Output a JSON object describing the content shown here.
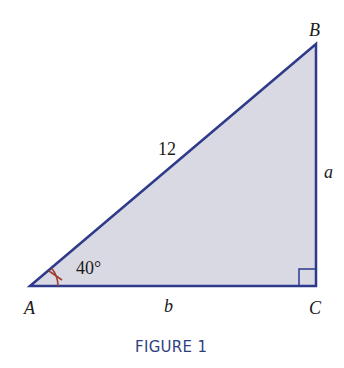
{
  "figure": {
    "caption": "FIGURE 1",
    "colors": {
      "fill": "#d9d9e4",
      "edge": "#2e3a8a",
      "angle_mark": "#a33b2b",
      "caption": "#2f3f7f"
    },
    "vertices": {
      "A": {
        "label": "A",
        "x": 30,
        "y": 286
      },
      "B": {
        "label": "B",
        "x": 316,
        "y": 44
      },
      "C": {
        "label": "C",
        "x": 316,
        "y": 286
      }
    },
    "sides": {
      "hypotenuse": "12",
      "opposite": "a",
      "adjacent": "b"
    },
    "angle_A": "40°",
    "right_angle_at": "C"
  }
}
